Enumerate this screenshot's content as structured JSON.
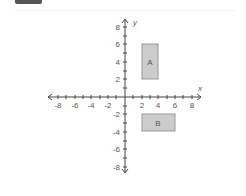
{
  "diagram": {
    "x_axis_label": "x",
    "y_axis_label": "y",
    "x_ticks": [
      "-8",
      "-6",
      "-4",
      "-2",
      "2",
      "4",
      "6",
      "8"
    ],
    "y_ticks": [
      "8",
      "6",
      "4",
      "2",
      "-2",
      "-4",
      "-6",
      "-8"
    ],
    "shapes": [
      {
        "label": "A",
        "x1": 2,
        "x2": 4,
        "y1": 2,
        "y2": 6,
        "fill": "#cccccc"
      },
      {
        "label": "B",
        "x1": 2,
        "x2": 6,
        "y1": -2,
        "y2": -4,
        "fill": "#cccccc"
      }
    ],
    "colors": {
      "axis": "#444444",
      "shape_fill": "#cccccc",
      "shape_stroke": "#999999",
      "text": "#555555"
    }
  }
}
